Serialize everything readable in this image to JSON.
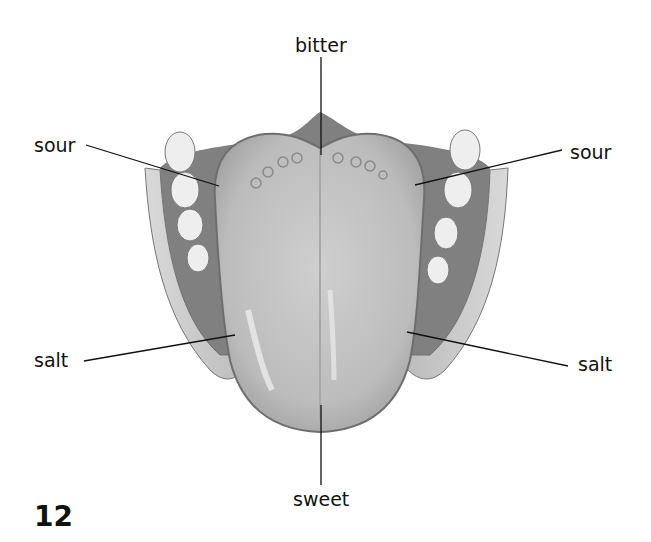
{
  "diagram": {
    "labels": {
      "top": "bitter",
      "upper_left": "sour",
      "upper_right": "sour",
      "lower_left": "salt",
      "lower_right": "salt",
      "bottom": "sweet"
    },
    "page_number": "12"
  },
  "colors": {
    "background": "#ffffff",
    "tongue_fill": "#bdbdbd",
    "tongue_edge": "#6e6e6e",
    "mouth_dark": "#5a5a5a",
    "gum": "#a9a9a9",
    "teeth": "#eeeeee",
    "leader_line": "#111111",
    "text": "#111111"
  }
}
